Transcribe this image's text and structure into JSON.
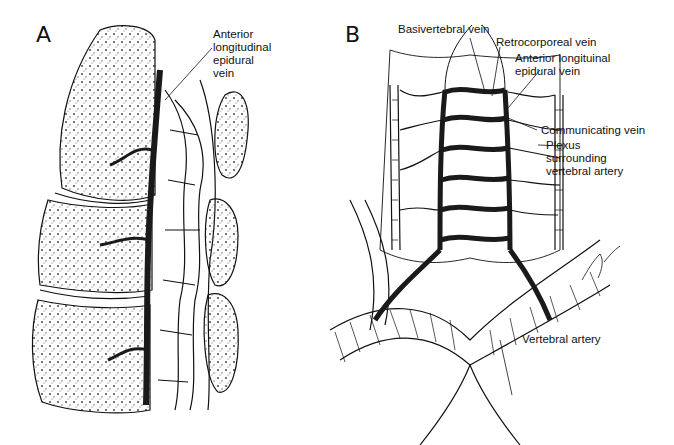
{
  "figure": {
    "panels": [
      {
        "id": "A",
        "letter": "A",
        "labels": [
          {
            "text_lines": [
              "Anterior",
              "longitudinal",
              "epidural",
              "vein"
            ]
          }
        ]
      },
      {
        "id": "B",
        "letter": "B",
        "labels": [
          {
            "text": "Basivertebral vein"
          },
          {
            "text": "Retrocorporeal vein"
          },
          {
            "text_lines": [
              "Anterior longituinal",
              "epidural vein"
            ]
          },
          {
            "text": "Communicating vein"
          },
          {
            "text_lines": [
              "Plexus",
              "surrounding",
              "vertebral artery"
            ]
          },
          {
            "text": "Vertebral artery"
          }
        ],
        "signature": "Dolge"
      }
    ],
    "colors": {
      "background": "#ffffff",
      "ink": "#111111",
      "vein_fill": "#1a1a1a"
    }
  }
}
